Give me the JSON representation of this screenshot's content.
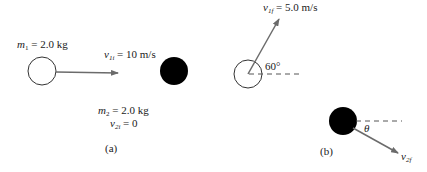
{
  "panel_a": {
    "caption": "(a)",
    "m1_label": {
      "sym": "m",
      "sub": "1",
      "value": " = 2.0 kg"
    },
    "v1i_label": {
      "sym": "v",
      "sub": "1i",
      "value": " = 10 m/s"
    },
    "m2_label": {
      "sym": "m",
      "sub": "2",
      "value": " = 2.0 kg"
    },
    "v2i_label": {
      "sym": "v",
      "sub": "2i",
      "value": " = 0"
    }
  },
  "panel_b": {
    "caption": "(b)",
    "v1f_label": {
      "sym": "v",
      "sub": "1f",
      "value": " = 5.0 m/s"
    },
    "angle_label": "60°",
    "theta_label": "θ",
    "v2f_label": {
      "sym": "v",
      "sub": "2f"
    }
  },
  "colors": {
    "arrow": "#6b6b6b",
    "ball_dark": "#000000",
    "outline": "#333333"
  }
}
